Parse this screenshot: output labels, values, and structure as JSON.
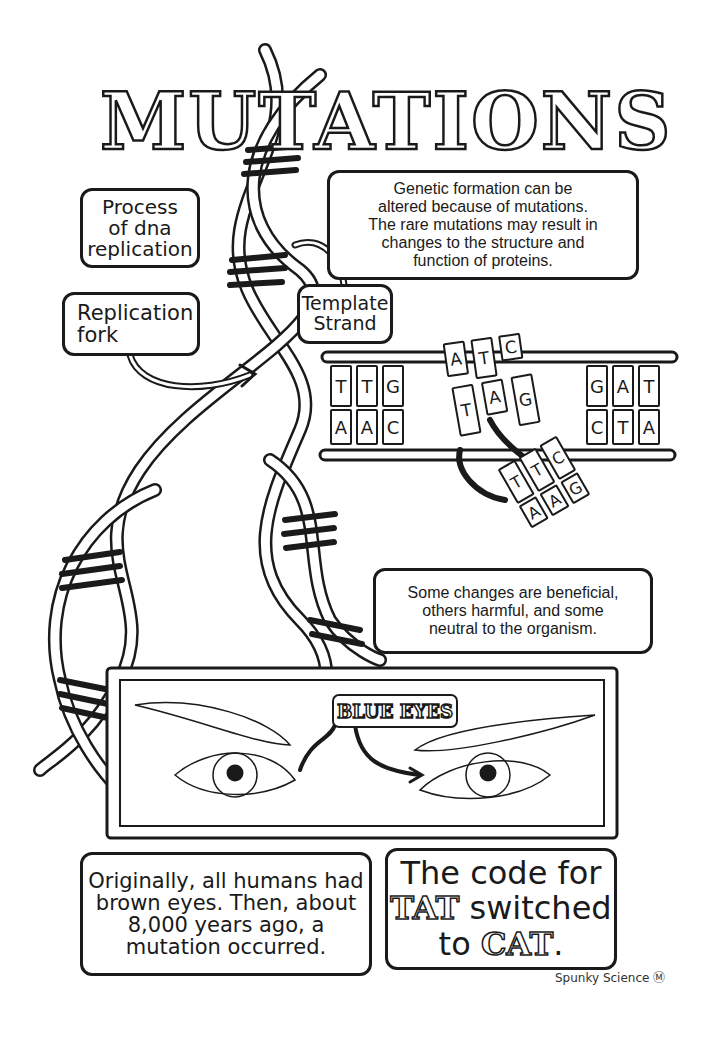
{
  "title": "MUTATIONS",
  "labels": {
    "process": [
      "Process",
      "of dna",
      "replication"
    ],
    "fork": [
      "Replication",
      "fork"
    ],
    "template": [
      "Template",
      "Strand"
    ]
  },
  "info_boxes": {
    "genetic": [
      "Genetic formation can be",
      "altered because of mutations.",
      "The rare mutations may result in",
      "changes to the structure and",
      "function of proteins."
    ],
    "changes": [
      "Some changes are beneficial,",
      "others harmful, and some",
      "neutral to the organism."
    ],
    "origin": [
      "Originally, all humans had",
      "brown eyes. Then, about",
      "8,000 years ago, a",
      "mutation occurred."
    ],
    "code": {
      "line1": "The code for",
      "tat": "TAT",
      "line2": "switched",
      "to": "to",
      "cat": "CAT",
      "period": "."
    }
  },
  "eyes_panel": {
    "label": "BLUE EYES"
  },
  "dna_ladder": {
    "left_top": [
      "T",
      "T",
      "G"
    ],
    "left_bottom": [
      "A",
      "A",
      "C"
    ],
    "right_top": [
      "G",
      "A",
      "T"
    ],
    "right_bottom": [
      "C",
      "T",
      "A"
    ],
    "mid_loose_top": [
      "A",
      "T",
      "C"
    ],
    "mid_loose_bottom": [
      "T",
      "A",
      "G"
    ],
    "swapped_top": [
      "T",
      "T",
      "C"
    ],
    "swapped_bottom": [
      "A",
      "A",
      "G"
    ]
  },
  "footer": "Spunky Science Ⓜ"
}
